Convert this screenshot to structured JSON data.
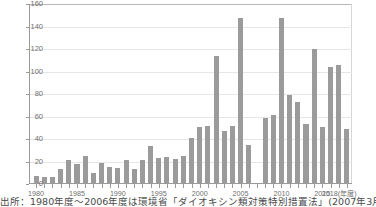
{
  "chart_data": {
    "type": "bar",
    "title": "",
    "subtitle": "",
    "xlabel": "(年度)",
    "ylabel": "",
    "ylim": [
      0,
      160
    ],
    "ytick_values": [
      0,
      20,
      40,
      60,
      80,
      100,
      120,
      140,
      160
    ],
    "ytick_labels": [
      "0",
      "20",
      "40",
      "60",
      "80",
      "100",
      "120",
      "140",
      "160"
    ],
    "xtick_labels": [
      "1980",
      "1985",
      "1990",
      "1995",
      "2000",
      "2005",
      "2010",
      "2015",
      "2018(年度)"
    ],
    "xtick_years": [
      1980,
      1985,
      1990,
      1995,
      2000,
      2005,
      2010,
      2015,
      2018
    ],
    "grid": true,
    "legend": "none",
    "bar_color": "#9b9b9b",
    "categories": [
      "1980",
      "1981",
      "1982",
      "1983",
      "1984",
      "1985",
      "1986",
      "1987",
      "1988",
      "1989",
      "1990",
      "1991",
      "1992",
      "1993",
      "1994",
      "1995",
      "1996",
      "1997",
      "1998",
      "1999",
      "2000",
      "2001",
      "2002",
      "2003",
      "2004",
      "2005",
      "2006",
      "2007",
      "2008",
      "2009",
      "2010",
      "2011",
      "2012",
      "2013",
      "2014",
      "2015",
      "2016",
      "2017",
      "2018"
    ],
    "values": [
      7,
      6,
      6,
      13,
      21,
      18,
      25,
      10,
      19,
      15,
      14,
      21,
      13,
      21,
      34,
      23,
      24,
      22,
      25,
      41,
      51,
      52,
      114,
      47,
      52,
      148,
      35,
      null,
      59,
      61,
      148,
      79,
      73,
      53,
      120,
      51,
      104,
      106,
      49
    ],
    "annotations": {
      "missing_year": "2007",
      "missing_note": "no bar plotted for 2007"
    }
  },
  "source": {
    "text": "出所：1980年度〜2006年度は環境省「ダイオキシン類対策特別措置法」(2007年3月)"
  }
}
